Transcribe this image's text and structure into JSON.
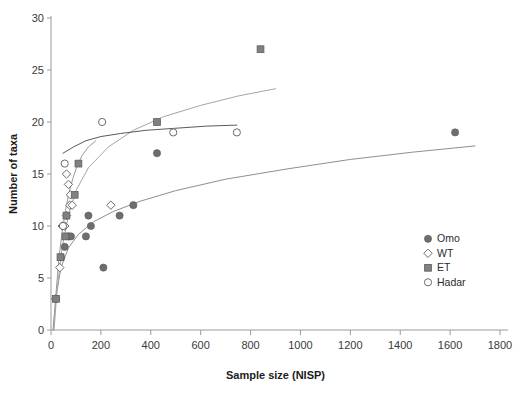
{
  "chart_data": {
    "type": "scatter",
    "title": "",
    "xlabel": "Sample size (NISP)",
    "ylabel": "Number of taxa",
    "xlim": [
      0,
      1800
    ],
    "ylim": [
      0,
      30
    ],
    "xticks": [
      0,
      200,
      400,
      600,
      800,
      1000,
      1200,
      1400,
      1600,
      1800
    ],
    "yticks": [
      0,
      5,
      10,
      15,
      20,
      25,
      30
    ],
    "grid": false,
    "legend_position": "right-middle",
    "series": [
      {
        "name": "Omo",
        "marker": "filled-circle",
        "color": "#6e6e6e",
        "points": [
          [
            20,
            3
          ],
          [
            40,
            7
          ],
          [
            55,
            8
          ],
          [
            70,
            9
          ],
          [
            80,
            9
          ],
          [
            140,
            9
          ],
          [
            150,
            11
          ],
          [
            160,
            10
          ],
          [
            210,
            6
          ],
          [
            275,
            11
          ],
          [
            330,
            12
          ],
          [
            425,
            17
          ],
          [
            1620,
            19
          ]
        ],
        "trend": {
          "label": "Omo trend",
          "color": "#8f8f8f",
          "points": [
            [
              8,
              0
            ],
            [
              20,
              3.2
            ],
            [
              40,
              6.0
            ],
            [
              70,
              7.9
            ],
            [
              110,
              9.2
            ],
            [
              170,
              10.4
            ],
            [
              250,
              11.4
            ],
            [
              360,
              12.4
            ],
            [
              500,
              13.4
            ],
            [
              700,
              14.5
            ],
            [
              950,
              15.5
            ],
            [
              1200,
              16.4
            ],
            [
              1450,
              17.1
            ],
            [
              1700,
              17.7
            ]
          ]
        }
      },
      {
        "name": "WT",
        "marker": "open-diamond",
        "color": "#7d7d7d",
        "points": [
          [
            18,
            3
          ],
          [
            35,
            6
          ],
          [
            45,
            10
          ],
          [
            55,
            10
          ],
          [
            62,
            11
          ],
          [
            75,
            12
          ],
          [
            85,
            12
          ],
          [
            78,
            13
          ],
          [
            70,
            14
          ],
          [
            62,
            15
          ],
          [
            240,
            12
          ]
        ],
        "trend": {
          "label": "WT trend",
          "color": "#9a9a9a",
          "points": [
            [
              10,
              0
            ],
            [
              20,
              3.5
            ],
            [
              32,
              7.0
            ],
            [
              45,
              9.5
            ],
            [
              58,
              11.5
            ],
            [
              72,
              13.2
            ],
            [
              88,
              14.6
            ],
            [
              105,
              15.8
            ],
            [
              125,
              16.8
            ],
            [
              150,
              17.6
            ],
            [
              180,
              18.2
            ]
          ]
        }
      },
      {
        "name": "ET",
        "marker": "filled-square",
        "color": "#808080",
        "points": [
          [
            20,
            3
          ],
          [
            38,
            7
          ],
          [
            58,
            9
          ],
          [
            62,
            11
          ],
          [
            95,
            13
          ],
          [
            110,
            16
          ],
          [
            425,
            20
          ],
          [
            840,
            27
          ]
        ],
        "trend": {
          "label": "ET trend",
          "color": "#a5a5a5",
          "points": [
            [
              12,
              0
            ],
            [
              25,
              4.0
            ],
            [
              45,
              8.0
            ],
            [
              70,
              11.0
            ],
            [
              100,
              13.4
            ],
            [
              150,
              15.6
            ],
            [
              230,
              17.6
            ],
            [
              330,
              19.2
            ],
            [
              450,
              20.5
            ],
            [
              600,
              21.6
            ],
            [
              750,
              22.5
            ],
            [
              900,
              23.2
            ]
          ]
        }
      },
      {
        "name": "Hadar",
        "marker": "open-circle",
        "color": "#7a7a7a",
        "points": [
          [
            48,
            10
          ],
          [
            55,
            16
          ],
          [
            205,
            20
          ],
          [
            490,
            19
          ],
          [
            745,
            19
          ]
        ],
        "trend": {
          "label": "Hadar trend",
          "color": "#5a5a5a",
          "points": [
            [
              48,
              17.0
            ],
            [
              90,
              17.6
            ],
            [
              140,
              18.2
            ],
            [
              200,
              18.6
            ],
            [
              280,
              18.9
            ],
            [
              380,
              19.2
            ],
            [
              500,
              19.4
            ],
            [
              620,
              19.6
            ],
            [
              745,
              19.7
            ]
          ]
        }
      }
    ]
  },
  "axes": {
    "x_title": "Sample size (NISP)",
    "y_title": "Number of taxa",
    "x_tick_labels": [
      "0",
      "200",
      "400",
      "600",
      "800",
      "1000",
      "1200",
      "1400",
      "1600",
      "1800"
    ],
    "y_tick_labels": [
      "0",
      "5",
      "10",
      "15",
      "20",
      "25",
      "30"
    ]
  },
  "legend": {
    "items": [
      {
        "label": "Omo",
        "marker": "filled-circle"
      },
      {
        "label": "WT",
        "marker": "open-diamond"
      },
      {
        "label": "ET",
        "marker": "filled-square"
      },
      {
        "label": "Hadar",
        "marker": "open-circle"
      }
    ]
  },
  "colors": {
    "axis": "#9a9a9a",
    "text": "#2b2b2b",
    "marker_gray": "#6e6e6e",
    "trend_light": "#a5a5a5",
    "trend_dark": "#5a5a5a"
  }
}
